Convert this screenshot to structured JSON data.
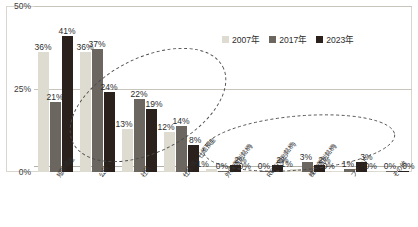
{
  "chart_data": {
    "type": "bar",
    "title": "",
    "xlabel": "",
    "ylabel": "",
    "ylim": [
      0,
      50
    ],
    "yticks": [
      "0%",
      "25%",
      "50%"
    ],
    "grid": true,
    "legend_position": "top-right",
    "categories": [
      "短期資産",
      "公債",
      "社債",
      "仕組債・仕組預金",
      "外債(個別銘柄)",
      "REIT(個別銘柄)",
      "株式(個別銘柄)",
      "ファンド",
      "その他"
    ],
    "series": [
      {
        "name": "2007年",
        "color": "#dedbd0",
        "values": [
          36,
          36,
          13,
          12,
          1,
          0,
          1,
          0,
          0
        ],
        "labels": [
          "36%",
          "36%",
          "13%",
          "12%",
          "1%",
          "0%",
          "1%",
          "0%",
          "0%"
        ]
      },
      {
        "name": "2017年",
        "color": "#6b6660",
        "values": [
          21,
          37,
          22,
          14,
          0,
          0,
          3,
          1,
          0
        ],
        "labels": [
          "21%",
          "37%",
          "22%",
          "14%",
          "0%",
          "0%",
          "3%",
          "1%",
          "0%"
        ]
      },
      {
        "name": "2023年",
        "color": "#2b211c",
        "values": [
          41,
          24,
          19,
          8,
          2,
          2,
          2,
          3,
          0
        ],
        "labels": [
          "41%",
          "24%",
          "19%",
          "8%",
          "2%",
          "2%",
          "2%",
          "3%",
          "0%"
        ]
      }
    ],
    "annotations": [
      {
        "name": "ellipse-left",
        "shape": "dashed-ellipse"
      },
      {
        "name": "ellipse-right",
        "shape": "dashed-ellipse"
      }
    ]
  },
  "legend": {
    "items": [
      {
        "label": "2007年",
        "color": "#dedbd0"
      },
      {
        "label": "2017年",
        "color": "#6b6660"
      },
      {
        "label": "2023年",
        "color": "#2b211c"
      }
    ]
  },
  "axis": {
    "y": {
      "ticks": [
        {
          "label": "50%",
          "value": 50
        },
        {
          "label": "25%",
          "value": 25
        },
        {
          "label": "0%",
          "value": 0
        }
      ]
    }
  },
  "colors": {
    "series_2007": "#dedbd0",
    "series_2017": "#6b6660",
    "series_2023": "#2b211c",
    "grid": "#c9c5bd",
    "frame": "#d9d6cf",
    "text": "#2d2d2d"
  }
}
